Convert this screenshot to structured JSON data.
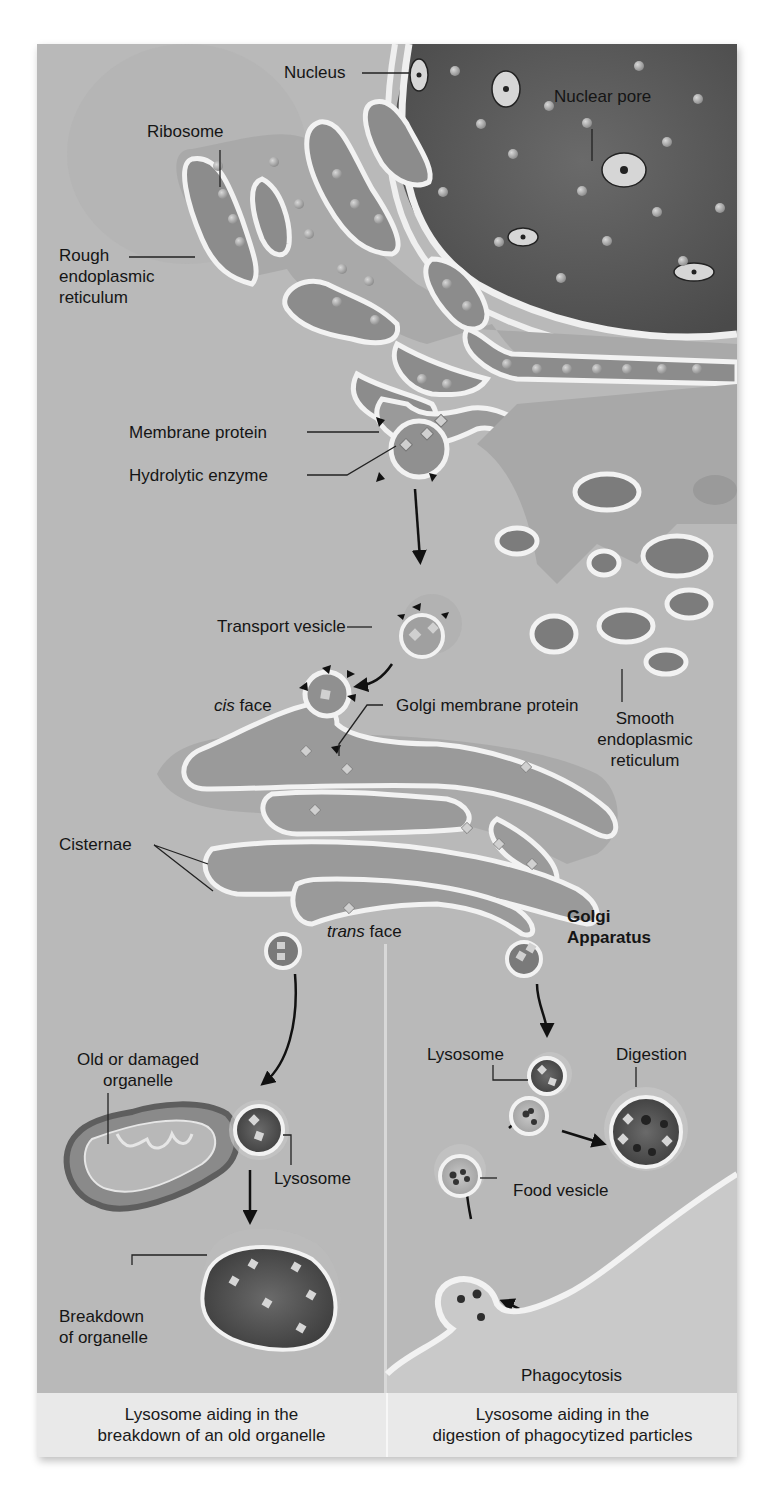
{
  "figure": {
    "colors": {
      "background": "#b9b9b9",
      "nucleus": "#5e5e5e",
      "membrane": "#f2f2f2",
      "lumen": "#8e8e8e",
      "caption_bg": "#e9e9e9",
      "text": "#151515"
    },
    "labels": {
      "nucleus": "Nucleus",
      "nuclear_pore": "Nuclear pore",
      "ribosome": "Ribosome",
      "rough_er": [
        "Rough",
        "endoplasmic",
        "reticulum"
      ],
      "membrane_protein": "Membrane protein",
      "hydrolytic_enzyme": "Hydrolytic enzyme",
      "transport_vesicle": "Transport vesicle",
      "cis_face_italic": "cis",
      "cis_face_rest": " face",
      "golgi_membrane_protein": "Golgi membrane protein",
      "smooth_er": [
        "Smooth",
        "endoplasmic",
        "reticulum"
      ],
      "cisternae": "Cisternae",
      "trans_face_italic": "trans",
      "trans_face_rest": " face",
      "golgi_apparatus": [
        "Golgi",
        "Apparatus"
      ],
      "old_organelle": [
        "Old or damaged",
        "organelle"
      ],
      "lysosome_left": "Lysosome",
      "breakdown": [
        "Breakdown",
        "of organelle"
      ],
      "lysosome_right": "Lysosome",
      "digestion": "Digestion",
      "food_vesicle": "Food vesicle",
      "phagocytosis": "Phagocytosis"
    },
    "captions": {
      "left": [
        "Lysosome aiding in the",
        "breakdown of an old organelle"
      ],
      "right": [
        "Lysosome aiding in the",
        "digestion of phagocytized particles"
      ]
    }
  }
}
